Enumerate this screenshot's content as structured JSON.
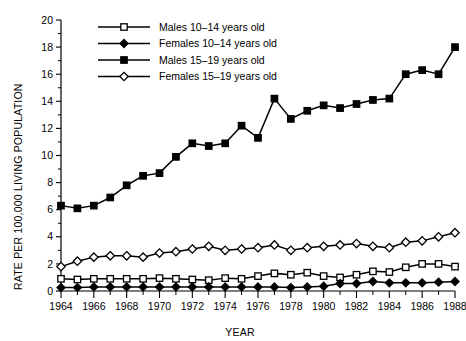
{
  "chart_data": {
    "type": "line",
    "title": "",
    "xlabel": "YEAR",
    "ylabel": "RATE PER 100,000 LIVING POPULATION",
    "xlim": [
      1964,
      1988
    ],
    "ylim": [
      0,
      20
    ],
    "ytick_step": 2,
    "yticks": [
      0,
      2,
      4,
      6,
      8,
      10,
      12,
      14,
      16,
      18,
      20
    ],
    "xticks": [
      1964,
      1966,
      1968,
      1970,
      1972,
      1974,
      1976,
      1978,
      1980,
      1982,
      1984,
      1986,
      1988
    ],
    "x_minor_every": 1,
    "grid": false,
    "legend_position": "top-left",
    "x": [
      1964,
      1965,
      1966,
      1967,
      1968,
      1969,
      1970,
      1971,
      1972,
      1973,
      1974,
      1975,
      1976,
      1977,
      1978,
      1979,
      1980,
      1981,
      1982,
      1983,
      1984,
      1985,
      1986,
      1987,
      1988
    ],
    "series": [
      {
        "name": "Males 10–14 years old",
        "marker": "open-square",
        "values": [
          0.9,
          0.85,
          0.9,
          0.9,
          0.9,
          0.9,
          0.95,
          0.9,
          0.85,
          0.8,
          0.95,
          0.9,
          1.1,
          1.3,
          1.2,
          1.35,
          1.1,
          1.0,
          1.2,
          1.45,
          1.4,
          1.75,
          2.0,
          2.0,
          1.8
        ]
      },
      {
        "name": "Females 10–14 years old",
        "marker": "filled-diamond",
        "values": [
          0.25,
          0.25,
          0.3,
          0.3,
          0.3,
          0.3,
          0.3,
          0.3,
          0.3,
          0.3,
          0.3,
          0.3,
          0.3,
          0.3,
          0.25,
          0.3,
          0.35,
          0.55,
          0.55,
          0.7,
          0.6,
          0.6,
          0.6,
          0.65,
          0.7
        ]
      },
      {
        "name": "Males 15–19 years old",
        "marker": "filled-square",
        "values": [
          6.3,
          6.1,
          6.3,
          6.9,
          7.8,
          8.5,
          8.7,
          9.9,
          10.9,
          10.7,
          10.9,
          12.2,
          11.3,
          14.2,
          12.7,
          13.3,
          13.7,
          13.5,
          13.8,
          14.1,
          14.2,
          16.0,
          16.3,
          16.0,
          18.0
        ]
      },
      {
        "name": "Females 15–19 years old",
        "marker": "open-diamond",
        "values": [
          1.8,
          2.2,
          2.5,
          2.6,
          2.6,
          2.5,
          2.8,
          2.9,
          3.1,
          3.3,
          3.0,
          3.1,
          3.2,
          3.4,
          3.0,
          3.2,
          3.3,
          3.4,
          3.5,
          3.3,
          3.2,
          3.6,
          3.7,
          4.0,
          4.3
        ]
      }
    ]
  },
  "legend": {
    "items": [
      {
        "label": "Males 10–14 years old"
      },
      {
        "label": "Females 10–14 years old"
      },
      {
        "label": "Males 15–19 years old"
      },
      {
        "label": "Females 15–19 years old"
      }
    ]
  },
  "axes": {
    "y_title": "RATE PER 100,000 LIVING POPULATION",
    "x_title": "YEAR"
  }
}
